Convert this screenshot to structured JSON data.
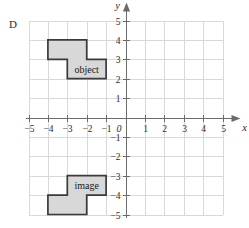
{
  "figure": {
    "part_label": "D",
    "background_color": "#ffffff",
    "grid_color": "#d9d9d9",
    "axis_color": "#6b6b6b",
    "shape_fill": "#d8d8d8",
    "shape_stroke": "#3a3a3a",
    "text_color": "#2b2b2b"
  },
  "chart_data": {
    "type": "scatter",
    "title": "",
    "xlabel": "x",
    "ylabel": "y",
    "xlim": [
      -5,
      5
    ],
    "ylim": [
      -5,
      5
    ],
    "grid": true,
    "legend": "none",
    "x_ticks": [
      -5,
      -4,
      -3,
      -2,
      -1,
      1,
      2,
      3,
      4,
      5
    ],
    "y_ticks": [
      5,
      4,
      3,
      2,
      1,
      -1,
      -2,
      -3,
      -4,
      -5
    ],
    "x_tick_labels": [
      "−5",
      "−4",
      "−3",
      "−2",
      "−1",
      "1",
      "2",
      "3",
      "4",
      "5"
    ],
    "y_tick_labels": [
      "5",
      "4",
      "3",
      "2",
      "1",
      "−1",
      "−2",
      "−3",
      "−4",
      "−5"
    ],
    "origin_label": "0",
    "shapes": [
      {
        "name": "object",
        "label": "object",
        "label_point": [
          -2.0,
          2.5
        ],
        "vertices": [
          [
            -4,
            4
          ],
          [
            -2,
            4
          ],
          [
            -2,
            3
          ],
          [
            -1,
            3
          ],
          [
            -1,
            2
          ],
          [
            -3,
            2
          ],
          [
            -3,
            3
          ],
          [
            -4,
            3
          ]
        ]
      },
      {
        "name": "image",
        "label": "image",
        "label_point": [
          -2.0,
          -3.5
        ],
        "vertices": [
          [
            -4,
            -5
          ],
          [
            -2,
            -5
          ],
          [
            -2,
            -4
          ],
          [
            -1,
            -4
          ],
          [
            -1,
            -3
          ],
          [
            -3,
            -3
          ],
          [
            -3,
            -4
          ],
          [
            -4,
            -4
          ]
        ]
      }
    ]
  }
}
